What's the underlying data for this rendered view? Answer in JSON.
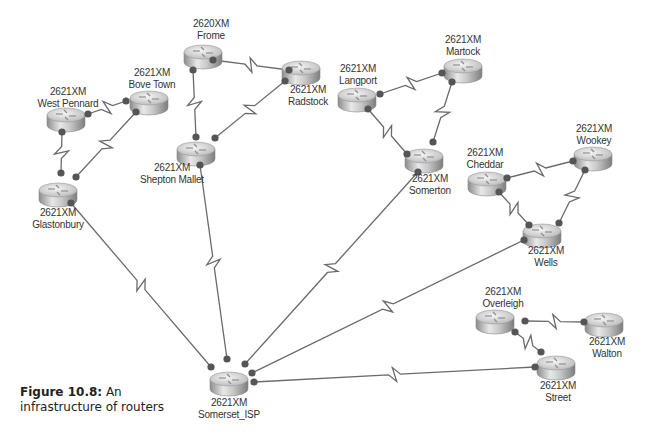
{
  "caption": {
    "figure_label": "Figure 10.8:",
    "text_line1": " An",
    "text_line2": "infrastructure of routers"
  },
  "colors": {
    "link": "#6a6a6a",
    "endpoint": "#555555",
    "router_top": "#e4e4e4",
    "router_side": "#9a9a9a",
    "label": "#333333"
  },
  "routers": [
    {
      "id": "frome",
      "model": "2620XM",
      "name": "Frome",
      "x": 203,
      "y": 52,
      "lx": 211,
      "ly": 18
    },
    {
      "id": "radstock",
      "model": "2621XM",
      "name": "Radstock",
      "x": 301,
      "y": 68,
      "lx": 308,
      "ly": 84
    },
    {
      "id": "west-pennard",
      "model": "2621XM",
      "name": "West Pennard",
      "x": 66,
      "y": 115,
      "lx": 68,
      "ly": 86
    },
    {
      "id": "bove-town",
      "model": "2621XM",
      "name": "Bove Town",
      "x": 149,
      "y": 98,
      "lx": 152,
      "ly": 67
    },
    {
      "id": "glastonbury",
      "model": "2621XM",
      "name": "Glastonbury",
      "x": 58,
      "y": 190,
      "lx": 58,
      "ly": 207
    },
    {
      "id": "shepton-mallet",
      "model": "2621XM",
      "name": "Shepton Mallet",
      "x": 196,
      "y": 149,
      "lx": 172,
      "ly": 162
    },
    {
      "id": "langport",
      "model": "2621XM",
      "name": "Langport",
      "x": 357,
      "y": 95,
      "lx": 358,
      "ly": 63
    },
    {
      "id": "martock",
      "model": "2621XM",
      "name": "Martock",
      "x": 463,
      "y": 66,
      "lx": 463,
      "ly": 34
    },
    {
      "id": "somerton",
      "model": "2621XM",
      "name": "Somerton",
      "x": 424,
      "y": 156,
      "lx": 430,
      "ly": 173
    },
    {
      "id": "cheddar",
      "model": "2621XM",
      "name": "Cheddar",
      "x": 487,
      "y": 179,
      "lx": 485,
      "ly": 147
    },
    {
      "id": "wookey",
      "model": "2621XM",
      "name": "Wookey",
      "x": 593,
      "y": 154,
      "lx": 594,
      "ly": 123
    },
    {
      "id": "wells",
      "model": "2621XM",
      "name": "Wells",
      "x": 542,
      "y": 231,
      "lx": 546,
      "ly": 245
    },
    {
      "id": "overleigh",
      "model": "2621XM",
      "name": "Overleigh",
      "x": 495,
      "y": 317,
      "lx": 503,
      "ly": 286
    },
    {
      "id": "walton",
      "model": "2621XM",
      "name": "Walton",
      "x": 604,
      "y": 320,
      "lx": 607,
      "ly": 336
    },
    {
      "id": "street",
      "model": "2621XM",
      "name": "Street",
      "x": 556,
      "y": 363,
      "lx": 558,
      "ly": 380
    },
    {
      "id": "somerset-isp",
      "model": "2621XM",
      "name": "Somerset_ISP",
      "x": 229,
      "y": 379,
      "lx": 229,
      "ly": 397
    }
  ],
  "links": [
    {
      "from": "frome",
      "to": "radstock",
      "a": [
        213,
        60
      ],
      "b": [
        289,
        70
      ]
    },
    {
      "from": "frome",
      "to": "shepton-mallet",
      "a": [
        193,
        70
      ],
      "b": [
        196,
        137
      ]
    },
    {
      "from": "radstock",
      "to": "shepton-mallet",
      "a": [
        285,
        81
      ],
      "b": [
        215,
        138
      ]
    },
    {
      "from": "west-pennard",
      "to": "bove-town",
      "a": [
        88,
        114
      ],
      "b": [
        126,
        101
      ]
    },
    {
      "from": "west-pennard",
      "to": "glastonbury",
      "a": [
        62,
        132
      ],
      "b": [
        61,
        173
      ]
    },
    {
      "from": "bove-town",
      "to": "glastonbury",
      "a": [
        136,
        112
      ],
      "b": [
        76,
        177
      ]
    },
    {
      "from": "glastonbury",
      "to": "somerset-isp",
      "a": [
        71,
        203
      ],
      "b": [
        211,
        367
      ]
    },
    {
      "from": "shepton-mallet",
      "to": "somerset-isp",
      "a": [
        200,
        165
      ],
      "b": [
        227,
        359
      ]
    },
    {
      "from": "langport",
      "to": "martock",
      "a": [
        380,
        94
      ],
      "b": [
        442,
        73
      ]
    },
    {
      "from": "langport",
      "to": "somerton",
      "a": [
        368,
        109
      ],
      "b": [
        407,
        154
      ]
    },
    {
      "from": "martock",
      "to": "somerton",
      "a": [
        452,
        82
      ],
      "b": [
        433,
        142
      ]
    },
    {
      "from": "somerton",
      "to": "somerset-isp",
      "a": [
        418,
        172
      ],
      "b": [
        245,
        364
      ]
    },
    {
      "from": "cheddar",
      "to": "wookey",
      "a": [
        507,
        178
      ],
      "b": [
        573,
        161
      ]
    },
    {
      "from": "cheddar",
      "to": "wells",
      "a": [
        499,
        192
      ],
      "b": [
        529,
        225
      ]
    },
    {
      "from": "wookey",
      "to": "wells",
      "a": [
        585,
        170
      ],
      "b": [
        559,
        223
      ]
    },
    {
      "from": "wells",
      "to": "somerset-isp",
      "a": [
        524,
        240
      ],
      "b": [
        252,
        373
      ]
    },
    {
      "from": "overleigh",
      "to": "walton",
      "a": [
        525,
        321
      ],
      "b": [
        584,
        322
      ]
    },
    {
      "from": "overleigh",
      "to": "street",
      "a": [
        515,
        332
      ],
      "b": [
        541,
        352
      ]
    },
    {
      "from": "street",
      "to": "somerset-isp",
      "a": [
        535,
        367
      ],
      "b": [
        254,
        382
      ]
    }
  ]
}
